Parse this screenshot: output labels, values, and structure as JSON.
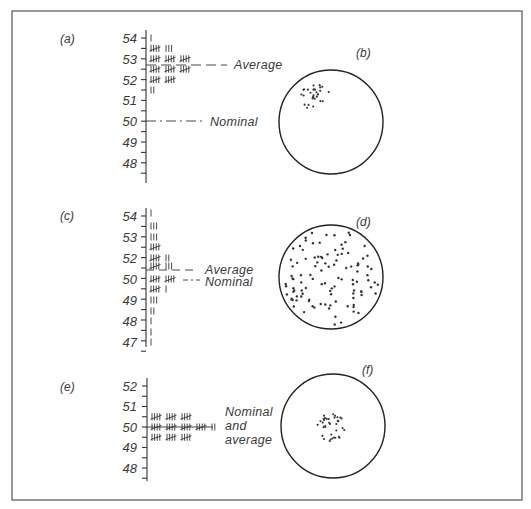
{
  "figure": {
    "panels": [
      {
        "id": "a",
        "label": "(a)",
        "axis_labels": [
          "54",
          "53",
          "52",
          "51",
          "50",
          "49",
          "48"
        ],
        "axis_values": [
          54,
          53,
          52,
          51,
          50,
          49,
          48
        ],
        "tallies": [
          {
            "value": 54.0,
            "count": 1
          },
          {
            "value": 53.5,
            "count": 8
          },
          {
            "value": 53.0,
            "count": 15
          },
          {
            "value": 52.5,
            "count": 15
          },
          {
            "value": 52.0,
            "count": 10
          },
          {
            "value": 51.5,
            "count": 2
          }
        ],
        "lines": [
          {
            "name": "average",
            "label": "Average",
            "value": 52.75,
            "style": "dashed"
          },
          {
            "name": "nominal",
            "label": "Nominal",
            "value": 50.0,
            "style": "dash-dot"
          }
        ]
      },
      {
        "id": "b",
        "label": "(b)",
        "description": "Target with tight cluster of hits off-centre (upper left) — precise but inaccurate"
      },
      {
        "id": "c",
        "label": "(c)",
        "axis_labels": [
          "54",
          "53",
          "52",
          "50",
          "49",
          "48",
          "47"
        ],
        "axis_values": [
          54,
          53,
          52,
          50.5,
          49.5,
          48.5,
          47.5
        ],
        "tallies": [
          {
            "value": 54.0,
            "count": 1
          },
          {
            "value": 53.5,
            "count": 3
          },
          {
            "value": 53.0,
            "count": 3
          },
          {
            "value": 52.5,
            "count": 5
          },
          {
            "value": 52.0,
            "count": 7
          },
          {
            "value": 51.5,
            "count": 8
          },
          {
            "value": 50.5,
            "count": 10
          },
          {
            "value": 50.0,
            "count": 6
          },
          {
            "value": 49.5,
            "count": 3
          },
          {
            "value": 49.0,
            "count": 2
          },
          {
            "value": 48.5,
            "count": 1
          },
          {
            "value": 48.0,
            "count": 1
          },
          {
            "value": 47.5,
            "count": 1
          }
        ],
        "lines": [
          {
            "name": "average",
            "label": "Average",
            "value": 51.0,
            "style": "dashed"
          },
          {
            "name": "nominal",
            "label": "Nominal",
            "value": 50.5,
            "style": "dash-dot"
          }
        ]
      },
      {
        "id": "d",
        "label": "(d)",
        "description": "Target with hits scattered widely across the whole face — imprecise"
      },
      {
        "id": "e",
        "label": "(e)",
        "axis_labels": [
          "52",
          "51",
          "50",
          "49",
          "48"
        ],
        "axis_values": [
          52,
          51,
          50,
          49,
          48
        ],
        "tallies": [
          {
            "value": 50.5,
            "count": 15
          },
          {
            "value": 50.0,
            "count": 22
          },
          {
            "value": 49.5,
            "count": 15
          }
        ],
        "lines": [
          {
            "name": "nominal-and-average",
            "label_lines": [
              "Nominal",
              "and",
              "average"
            ],
            "value": 50.0,
            "style": "solid"
          }
        ]
      },
      {
        "id": "f",
        "label": "(f)",
        "description": "Target with tight cluster of hits at centre — precise and accurate"
      }
    ]
  }
}
